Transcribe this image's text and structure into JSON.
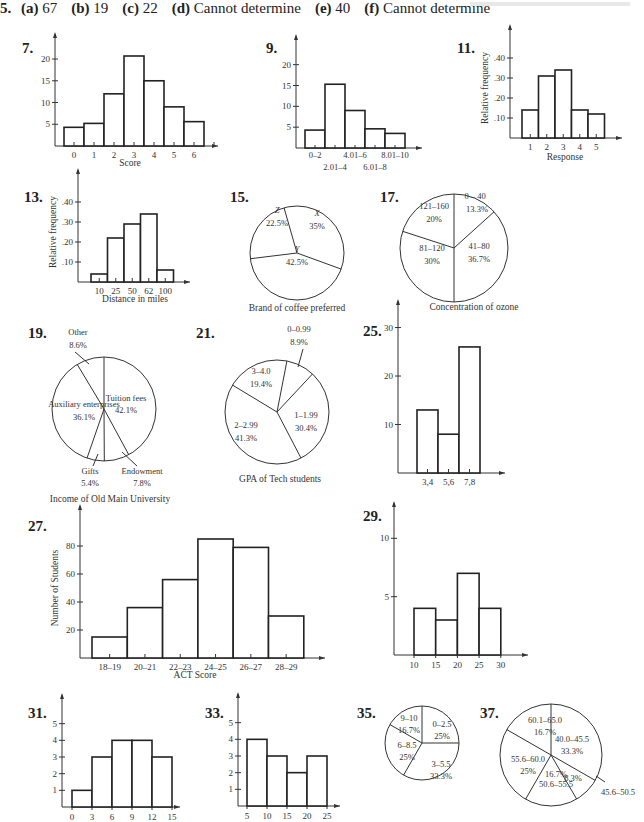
{
  "problem5": {
    "num": "5.",
    "parts": [
      {
        "label": "(a)",
        "value": "67"
      },
      {
        "label": "(b)",
        "value": "19"
      },
      {
        "label": "(c)",
        "value": "22"
      },
      {
        "label": "(d)",
        "value": "Cannot determine"
      },
      {
        "label": "(e)",
        "value": "40"
      },
      {
        "label": "(f)",
        "value": "Cannot determine"
      }
    ]
  },
  "chart_data": [
    {
      "id": "7",
      "type": "bar",
      "title": "",
      "xlabel": "Score",
      "ylabel": "",
      "categories": [
        "0",
        "1",
        "2",
        "3",
        "4",
        "5",
        "6"
      ],
      "values": [
        4.3,
        5.2,
        12,
        20.7,
        15,
        9,
        5.6
      ],
      "yticks": [
        5,
        10,
        15,
        20
      ],
      "ylim": [
        0,
        23
      ]
    },
    {
      "id": "9",
      "type": "bar",
      "title": "",
      "xlabel": "",
      "ylabel": "",
      "categories": [
        "0–2",
        "2.01–4",
        "4.01–6",
        "6.01–8",
        "8.01–10"
      ],
      "values": [
        4.3,
        15.3,
        9,
        4.6,
        3.5
      ],
      "yticks": [
        5,
        10,
        15,
        20
      ],
      "ylim": [
        0,
        24
      ]
    },
    {
      "id": "11",
      "type": "bar",
      "title": "",
      "xlabel": "Response",
      "ylabel": "Relative frequency",
      "categories": [
        "1",
        "2",
        "3",
        "4",
        "5"
      ],
      "values": [
        0.14,
        0.31,
        0.34,
        0.14,
        0.12
      ],
      "yticks": [
        ".10",
        ".20",
        ".30",
        ".40"
      ],
      "ylim": [
        0,
        0.5
      ]
    },
    {
      "id": "13",
      "type": "bar",
      "title": "",
      "xlabel": "Distance in miles",
      "ylabel": "Relative frequency",
      "categories": [
        "10",
        "25",
        "50",
        "62",
        "100"
      ],
      "values": [
        0.04,
        0.22,
        0.29,
        0.34,
        0.06
      ],
      "yticks": [
        ".10",
        ".20",
        ".30",
        ".40"
      ],
      "ylim": [
        0,
        0.5
      ]
    },
    {
      "id": "15",
      "type": "pie",
      "title": "Brand of coffee preferred",
      "slices": [
        {
          "label": "X",
          "value": 35,
          "text": "35%"
        },
        {
          "label": "Y",
          "value": 42.5,
          "text": "42.5%"
        },
        {
          "label": "Z",
          "value": 22.5,
          "text": "22.5%"
        }
      ]
    },
    {
      "id": "17",
      "type": "pie",
      "title": "Concentration of ozone",
      "slices": [
        {
          "label": "0 – 40",
          "value": 13.3,
          "text": "13.3%"
        },
        {
          "label": "41–80",
          "value": 36.7,
          "text": "36.7%"
        },
        {
          "label": "81–120",
          "value": 30,
          "text": "30%"
        },
        {
          "label": "121–160",
          "value": 20,
          "text": "20%"
        }
      ]
    },
    {
      "id": "19",
      "type": "pie",
      "title": "Income of Old Main University",
      "slices": [
        {
          "label": "Tuition fees",
          "value": 42.1,
          "text": "42.1%"
        },
        {
          "label": "Endowment",
          "value": 7.8,
          "text": "7.8%"
        },
        {
          "label": "Gifts",
          "value": 5.4,
          "text": "5.4%"
        },
        {
          "label": "Auxiliary enterprises",
          "value": 36.1,
          "text": "36.1%"
        },
        {
          "label": "Other",
          "value": 8.6,
          "text": "8.6%"
        }
      ]
    },
    {
      "id": "21",
      "type": "pie",
      "title": "GPA of Tech students",
      "slices": [
        {
          "label": "0–0.99",
          "value": 8.9,
          "text": "8.9%"
        },
        {
          "label": "1–1.99",
          "value": 30.4,
          "text": "30.4%"
        },
        {
          "label": "2–2.99",
          "value": 41.3,
          "text": "41.3%"
        },
        {
          "label": "3–4.0",
          "value": 19.4,
          "text": "19.4%"
        }
      ]
    },
    {
      "id": "25",
      "type": "bar",
      "title": "",
      "xlabel": "",
      "ylabel": "",
      "categories": [
        "3,4",
        "5,6",
        "7,8"
      ],
      "values": [
        13,
        8,
        26
      ],
      "yticks": [
        10,
        20,
        30
      ],
      "ylim": [
        0,
        33
      ]
    },
    {
      "id": "27",
      "type": "bar",
      "title": "",
      "xlabel": "ACT Score",
      "ylabel": "Number of Students",
      "categories": [
        "18–19",
        "20–21",
        "22–23",
        "24–25",
        "26–27",
        "28–29"
      ],
      "values": [
        15,
        36,
        56,
        85,
        79,
        30
      ],
      "yticks": [
        20,
        40,
        60,
        80
      ],
      "ylim": [
        0,
        100
      ]
    },
    {
      "id": "29",
      "type": "bar",
      "title": "",
      "xlabel": "",
      "ylabel": "",
      "categories": [
        "10–15",
        "15–20",
        "20–25",
        "25–30"
      ],
      "xticks": [
        "10",
        "15",
        "20",
        "25",
        "30"
      ],
      "values": [
        4,
        3,
        7,
        4
      ],
      "yticks": [
        5,
        10
      ],
      "ylim": [
        0,
        12
      ]
    },
    {
      "id": "31",
      "type": "bar",
      "title": "",
      "xlabel": "",
      "ylabel": "",
      "categories": [
        "0–3",
        "3–6",
        "6–9",
        "9–12",
        "12–15"
      ],
      "xticks": [
        "0",
        "3",
        "6",
        "9",
        "12",
        "15"
      ],
      "values": [
        1,
        3,
        4,
        4,
        3
      ],
      "yticks": [
        1,
        2,
        3,
        4,
        5
      ],
      "ylim": [
        0,
        6
      ]
    },
    {
      "id": "33",
      "type": "bar",
      "title": "",
      "xlabel": "",
      "ylabel": "",
      "categories": [
        "5–10",
        "10–15",
        "15–20",
        "20–25"
      ],
      "xticks": [
        "5",
        "10",
        "15",
        "20",
        "25"
      ],
      "values": [
        4,
        3,
        2,
        3
      ],
      "yticks": [
        1,
        2,
        3,
        4,
        5
      ],
      "ylim": [
        0,
        6
      ]
    },
    {
      "id": "35",
      "type": "pie",
      "title": "",
      "slices": [
        {
          "label": "0–2.5",
          "value": 25,
          "text": "25%"
        },
        {
          "label": "3–5.5",
          "value": 33.3,
          "text": "33.3%"
        },
        {
          "label": "6–8.5",
          "value": 25,
          "text": "25%"
        },
        {
          "label": "9–10",
          "value": 16.7,
          "text": "16.7%"
        }
      ]
    },
    {
      "id": "37",
      "type": "pie",
      "title": "",
      "slices": [
        {
          "label": "40.0–45.5",
          "value": 33.3,
          "text": "33.3%"
        },
        {
          "label": "45.6–50.5",
          "value": 8.3,
          "text": "8.3%"
        },
        {
          "label": "50.6–55.5",
          "value": 16.7,
          "text": "16.7%"
        },
        {
          "label": "55.6–60.0",
          "value": 25,
          "text": "25%"
        },
        {
          "label": "60.1–65.0",
          "value": 16.7,
          "text": "16.7%"
        }
      ]
    }
  ]
}
